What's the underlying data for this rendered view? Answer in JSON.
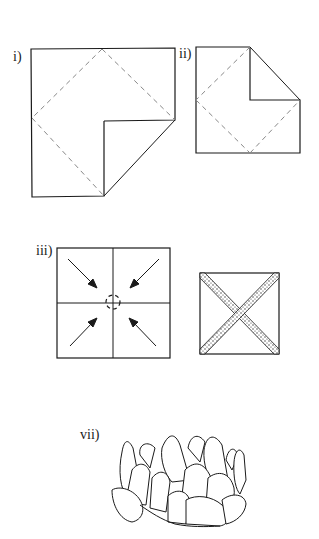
{
  "figure": {
    "type": "origami-folding-instructions",
    "steps": [
      {
        "id": "step-1",
        "label": "i)",
        "description": "Square with dashed diamond fold lines; bottom-right corner folded toward center"
      },
      {
        "id": "step-2",
        "label": "ii)",
        "description": "Smaller square with top-right corner folded toward center; dashed diamond fold lines"
      },
      {
        "id": "step-3",
        "label": "iii)",
        "description": "Square with center crease lines and four arrows pointing to a dashed circle at center"
      },
      {
        "id": "step-3b",
        "label": "",
        "description": "Square with two textured diagonal bands forming an X"
      },
      {
        "id": "step-7",
        "label": "vii)",
        "description": "Completed lotus flower illustration"
      }
    ],
    "colors": {
      "ink": "#1a1a1a",
      "dashed": "#888888",
      "background": "#ffffff"
    }
  }
}
